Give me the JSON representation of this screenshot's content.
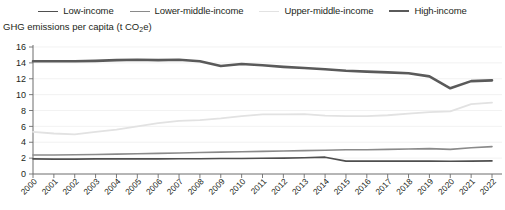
{
  "legend": {
    "position": "top-center",
    "items": [
      {
        "label": "Low-income",
        "color": "#4f4f4f",
        "width": 1.6
      },
      {
        "label": "Lower-middle-income",
        "color": "#8a8a8a",
        "width": 1.6
      },
      {
        "label": "Upper-middle-income",
        "color": "#e2e2e2",
        "width": 1.6
      },
      {
        "label": "High-income",
        "color": "#5a5a5a",
        "width": 2.6
      }
    ]
  },
  "axis_title": {
    "prefix": "GHG emissions per capita (t CO",
    "sub": "2",
    "suffix": "e)"
  },
  "chart_data": {
    "type": "line",
    "title": "GHG emissions per capita (t CO2e)",
    "xlabel": "",
    "ylabel": "GHG emissions per capita (t CO2e)",
    "ylim": [
      0,
      16
    ],
    "yticks": [
      0,
      2,
      4,
      6,
      8,
      10,
      12,
      14,
      16
    ],
    "grid": true,
    "grid_color": "#eaeaea",
    "x": [
      2000,
      2001,
      2002,
      2003,
      2004,
      2005,
      2006,
      2007,
      2008,
      2009,
      2010,
      2011,
      2012,
      2013,
      2014,
      2015,
      2016,
      2017,
      2018,
      2019,
      2020,
      2021,
      2022
    ],
    "categories": [
      "2000",
      "2001",
      "2002",
      "2003",
      "2004",
      "2005",
      "2006",
      "2007",
      "2008",
      "2009",
      "2010",
      "2011",
      "2012",
      "2013",
      "2014",
      "2015",
      "2016",
      "2017",
      "2018",
      "2019",
      "2020",
      "2021",
      "2022"
    ],
    "series": [
      {
        "name": "High-income",
        "color": "#5a5a5a",
        "width": 2.6,
        "values": [
          14.2,
          14.2,
          14.2,
          14.25,
          14.35,
          14.4,
          14.35,
          14.4,
          14.2,
          13.6,
          13.85,
          13.7,
          13.5,
          13.35,
          13.2,
          13.0,
          12.9,
          12.8,
          12.7,
          12.3,
          10.8,
          11.7,
          11.8
        ]
      },
      {
        "name": "Upper-middle-income",
        "color": "#e2e2e2",
        "width": 1.8,
        "values": [
          5.3,
          5.1,
          5.0,
          5.3,
          5.6,
          6.0,
          6.4,
          6.7,
          6.8,
          7.0,
          7.3,
          7.5,
          7.5,
          7.55,
          7.35,
          7.3,
          7.3,
          7.4,
          7.6,
          7.8,
          7.9,
          8.8,
          9.0
        ]
      },
      {
        "name": "Lower-middle-income",
        "color": "#8a8a8a",
        "width": 1.6,
        "values": [
          2.4,
          2.4,
          2.42,
          2.45,
          2.5,
          2.55,
          2.6,
          2.65,
          2.7,
          2.75,
          2.8,
          2.85,
          2.9,
          2.95,
          3.0,
          3.05,
          3.05,
          3.1,
          3.15,
          3.2,
          3.1,
          3.3,
          3.45
        ]
      },
      {
        "name": "Low-income",
        "color": "#4f4f4f",
        "width": 1.6,
        "values": [
          1.9,
          1.88,
          1.88,
          1.9,
          1.9,
          1.9,
          1.9,
          1.92,
          1.92,
          1.95,
          1.95,
          1.98,
          2.0,
          2.05,
          2.12,
          1.62,
          1.62,
          1.62,
          1.62,
          1.62,
          1.6,
          1.62,
          1.65
        ]
      }
    ]
  }
}
